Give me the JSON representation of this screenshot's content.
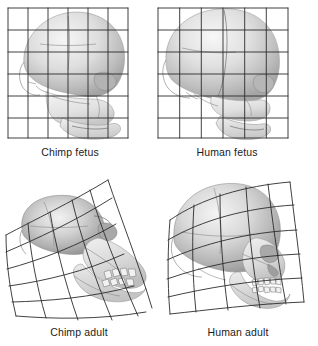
{
  "figure": {
    "background_color": "#ffffff",
    "grid_color": "#2b2b2b",
    "skull_tone_light": "#efefef",
    "skull_tone_mid": "#c9c9c9",
    "skull_tone_dark": "#9a9a9a",
    "caption_color": "#1b1b1b"
  },
  "panels": [
    {
      "id": "chimp-fetus",
      "caption": "Chimp fetus",
      "grid_type": "regular",
      "grid_columns": 6,
      "grid_rows": 6,
      "specimen": "chimpanzee",
      "life_stage": "fetus"
    },
    {
      "id": "human-fetus",
      "caption": "Human fetus",
      "grid_type": "regular",
      "grid_columns": 6,
      "grid_rows": 6,
      "specimen": "human",
      "life_stage": "fetus"
    },
    {
      "id": "chimp-adult",
      "caption": "Chimp adult",
      "grid_type": "deformed",
      "grid_columns": 6,
      "grid_rows": 6,
      "specimen": "chimpanzee",
      "life_stage": "adult"
    },
    {
      "id": "human-adult",
      "caption": "Human adult",
      "grid_type": "deformed",
      "grid_columns": 6,
      "grid_rows": 6,
      "specimen": "human",
      "life_stage": "adult"
    }
  ]
}
